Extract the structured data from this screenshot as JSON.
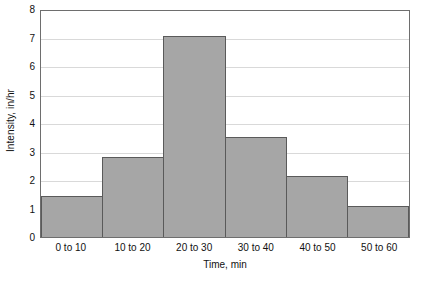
{
  "chart_data": {
    "type": "bar",
    "title": "",
    "subtitle": "",
    "xlabel": "Time, min",
    "ylabel": "Intensity, in/hr",
    "categories": [
      "0 to 10",
      "10 to 20",
      "20 to 30",
      "30 to 40",
      "40 to 50",
      "50 to 60"
    ],
    "values": [
      1.45,
      2.8,
      7.05,
      3.5,
      2.15,
      1.1
    ],
    "series": [
      {
        "name": "Intensity",
        "values": [
          1.45,
          2.8,
          7.05,
          3.5,
          2.15,
          1.1
        ]
      }
    ],
    "ylim": [
      0,
      8
    ],
    "y_ticks": [
      0,
      1,
      2,
      3,
      4,
      5,
      6,
      7,
      8
    ],
    "y_tick_labels": [
      "0",
      "1",
      "2",
      "3",
      "4",
      "5",
      "6",
      "7",
      "8"
    ],
    "grid": true,
    "grid_axis": "y",
    "legend": false,
    "legend_position": "none",
    "bar_gap": 0,
    "annotations": []
  },
  "style": {
    "bar_fill": "#a6a6a6",
    "bar_border": "#5a5a5a",
    "grid_color": "#d9d9d9",
    "axis_color": "#6e6e6e",
    "text_color": "#111111",
    "background": "#ffffff"
  }
}
